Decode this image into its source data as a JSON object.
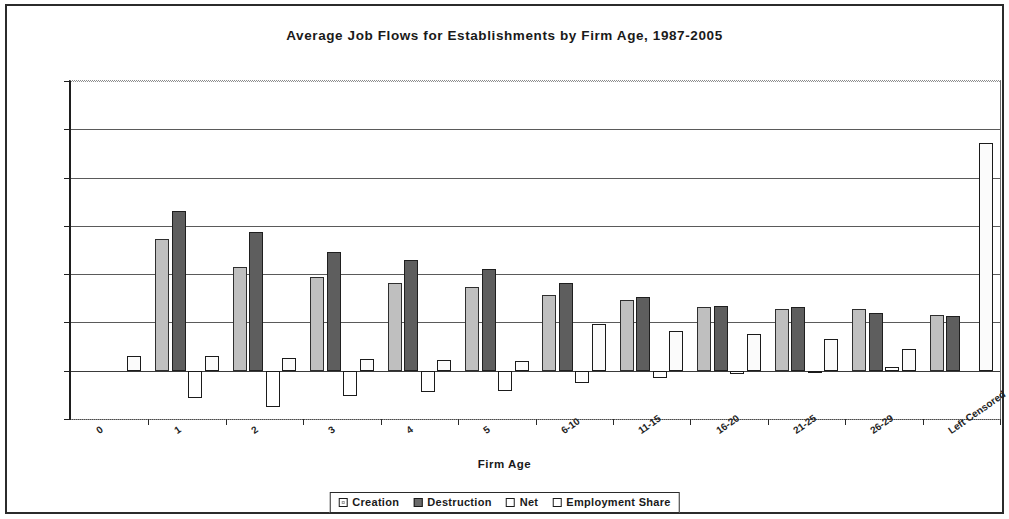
{
  "chart_data": {
    "type": "bar",
    "title": "Average Job Flows for Establishments by Firm Age, 1987-2005",
    "xlabel": "Firm Age",
    "ylabel": "",
    "ylim": [
      -10,
      60
    ],
    "ytick_values": [
      -10,
      0,
      10,
      20,
      30,
      40,
      50,
      60
    ],
    "ytick_labels": [
      "-10",
      "0",
      "10",
      "20",
      "30",
      "40",
      "50",
      "60"
    ],
    "grid": true,
    "legend_position": "bottom",
    "categories": [
      "0",
      "1",
      "2",
      "3",
      "4",
      "5",
      "6-10",
      "11-15",
      "16-20",
      "21-25",
      "26-29",
      "Left Censored"
    ],
    "series": [
      {
        "name": "Creation",
        "color": "#bfbfbf",
        "values": [
          null,
          27.3,
          21.5,
          19.5,
          18.2,
          17.3,
          15.6,
          14.6,
          13.1,
          12.8,
          12.7,
          11.5
        ]
      },
      {
        "name": "Destruction",
        "color": "#5e5e5e",
        "values": [
          null,
          33.0,
          28.8,
          24.5,
          23.0,
          21.0,
          18.2,
          15.3,
          13.5,
          13.1,
          12.0,
          11.3
        ]
      },
      {
        "name": "Net",
        "color": "#ffffff",
        "values": [
          null,
          -5.7,
          -7.6,
          -5.3,
          -4.5,
          -4.3,
          -2.6,
          -1.5,
          -0.7,
          -0.3,
          0.7,
          null
        ]
      },
      {
        "name": "Employment Share",
        "color": "#ffffff",
        "values": [
          3.0,
          3.0,
          2.6,
          2.5,
          2.2,
          2.1,
          9.7,
          8.2,
          7.7,
          6.5,
          4.5,
          47.2
        ]
      }
    ]
  },
  "legend": {
    "items": [
      {
        "label": "Creation",
        "swatch": "creation"
      },
      {
        "label": "Destruction",
        "swatch": "destruction"
      },
      {
        "label": "Net",
        "swatch": "net"
      },
      {
        "label": "Employment Share",
        "swatch": "share"
      }
    ]
  }
}
